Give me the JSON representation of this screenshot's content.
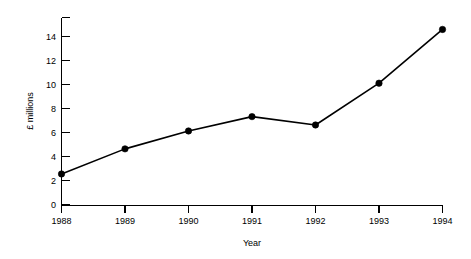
{
  "chart_data": {
    "type": "line",
    "title": "",
    "xlabel": "Year",
    "ylabel": "£ millions",
    "categories": [
      "1988",
      "1989",
      "1990",
      "1991",
      "1992",
      "1993",
      "1994"
    ],
    "x": [
      1988,
      1989,
      1990,
      1991,
      1992,
      1993,
      1994
    ],
    "values": [
      2.6,
      4.7,
      6.2,
      7.4,
      6.7,
      10.2,
      14.7
    ],
    "series": [
      {
        "name": "",
        "values": [
          2.6,
          4.7,
          6.2,
          7.4,
          6.7,
          10.2,
          14.7
        ]
      }
    ],
    "xlim": [
      1988,
      1994
    ],
    "ylim": [
      0,
      15.7
    ],
    "ytick_labels": [
      "0",
      "2",
      "4",
      "6",
      "8",
      "10",
      "12",
      "14"
    ],
    "ytick_values": [
      0,
      2,
      4,
      6,
      8,
      10,
      12,
      14
    ],
    "ytick_extra_unlabeled": [
      15.7
    ],
    "xtick_labels": [
      "1988",
      "1989",
      "1990",
      "1991",
      "1992",
      "1993",
      "1994"
    ],
    "grid": false,
    "legend": false,
    "legend_position": "none",
    "marker": "filled-circle",
    "line_color": "#000000",
    "marker_color": "#000000",
    "background_color": "#ffffff",
    "annotations": []
  },
  "axes": {
    "y_title": "£ millions",
    "x_title": "Year"
  }
}
